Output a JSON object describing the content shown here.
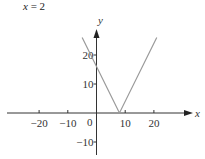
{
  "caption": "x = 2",
  "chart_data": {
    "type": "line",
    "title": "x = 2",
    "xlabel": "x",
    "ylabel": "y",
    "xlim": [
      -30,
      32
    ],
    "ylim": [
      -14,
      28
    ],
    "x_ticks": [
      -20,
      -10,
      10,
      20
    ],
    "x_tick_labels": [
      "−20",
      "−10",
      "10",
      "20"
    ],
    "y_ticks": [
      20,
      10,
      -10
    ],
    "y_tick_labels": [
      "20",
      "10",
      "−10"
    ],
    "origin_label": "0",
    "grid": false,
    "legend": null,
    "series": [
      {
        "name": "y = |2x − 16|",
        "color": "#9a9a9a",
        "x": [
          -5,
          0,
          8,
          21
        ],
        "y": [
          26,
          16,
          0,
          26
        ]
      }
    ]
  }
}
